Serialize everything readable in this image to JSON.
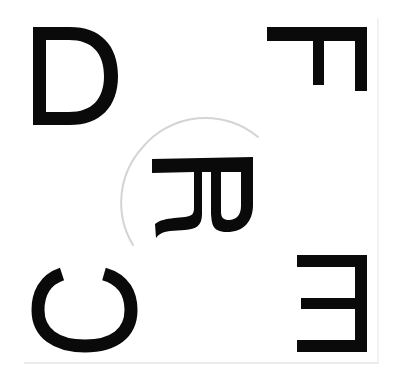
{
  "scene": {
    "description": "Black capital letters printed on white paper, some rotated or mirrored, with a faint circular arc around the center letter",
    "background_color": "#ffffff",
    "ink_color": "#0a0a0a",
    "circle_color": "#d4d4d4"
  },
  "letters": [
    {
      "char": "D",
      "position": "top-left",
      "orientation": "upright"
    },
    {
      "char": "F",
      "position": "top-right",
      "orientation": "rotated 90° clockwise"
    },
    {
      "char": "R",
      "position": "center",
      "orientation": "rotated 90° clockwise",
      "enclosed_by": "faint circle arc"
    },
    {
      "char": "C",
      "position": "bottom-left",
      "orientation": "rotated, opening facing up"
    },
    {
      "char": "E",
      "position": "bottom-right",
      "orientation": "mirrored horizontally"
    }
  ]
}
